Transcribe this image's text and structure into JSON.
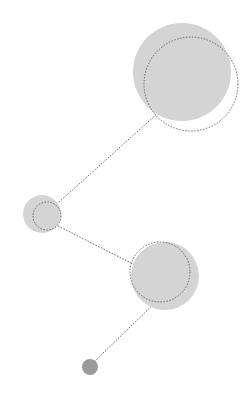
{
  "diagram": {
    "width": 252,
    "height": 398,
    "colors": {
      "background": "#ffffff",
      "fill_light": "#d4d4d4",
      "fill_dot": "#9a9a9a",
      "stroke": "#666666"
    },
    "nodes": [
      {
        "id": "top",
        "cx": 182,
        "cy": 72,
        "r": 49,
        "ring_cx": 191,
        "ring_cy": 84,
        "ring_r": 47
      },
      {
        "id": "left",
        "cx": 42,
        "cy": 214,
        "r": 19,
        "ring_cx": 47,
        "ring_cy": 216,
        "ring_r": 14
      },
      {
        "id": "bottom",
        "cx": 165,
        "cy": 276,
        "r": 34,
        "ring_cx": 160,
        "ring_cy": 272,
        "ring_r": 30
      },
      {
        "id": "dot",
        "cx": 90,
        "cy": 367,
        "r": 8
      }
    ],
    "edges": [
      {
        "from": "top",
        "to": "left",
        "x1": 158,
        "y1": 113,
        "x2": 58,
        "y2": 203
      },
      {
        "from": "left",
        "to": "bottom",
        "x1": 58,
        "y1": 226,
        "x2": 135,
        "y2": 265
      },
      {
        "from": "bottom",
        "to": "dot",
        "x1": 160,
        "y1": 298,
        "x2": 95,
        "y2": 361
      }
    ]
  }
}
